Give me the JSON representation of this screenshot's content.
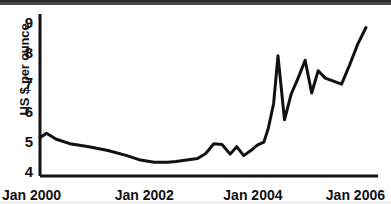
{
  "chart_data": {
    "type": "line",
    "title": "",
    "subtitle": "",
    "xlabel": "",
    "ylabel": "US $ per ounce",
    "ylim": [
      4,
      9
    ],
    "yticks": [
      4,
      5,
      6,
      7,
      8,
      9
    ],
    "ytick_labels": [
      "4",
      "5",
      "6",
      "7",
      "8",
      "9"
    ],
    "xlim": [
      "Jan 2000",
      "Jan 2006"
    ],
    "xticks": [
      "Jan 2000",
      "Jan 2002",
      "Jan 2004",
      "Jan 2006"
    ],
    "xtick_labels": [
      "Jan 2000",
      "Jan 2002",
      "Jan 2004",
      "Jan 2006"
    ],
    "grid": false,
    "legend": false,
    "legend_position": "none",
    "line_color": "#111111",
    "line_width": 3,
    "series": [
      {
        "name": "Silver price",
        "x": [
          0.0,
          0.12,
          0.3,
          0.55,
          0.9,
          1.25,
          1.6,
          1.85,
          2.1,
          2.35,
          2.5,
          2.7,
          2.9,
          3.05,
          3.2,
          3.35,
          3.5,
          3.62,
          3.75,
          3.88,
          4.0,
          4.12,
          4.2,
          4.3,
          4.38,
          4.5,
          4.62,
          4.75,
          4.88,
          5.0,
          5.12,
          5.25,
          5.4,
          5.55,
          5.7,
          5.85,
          6.0
        ],
        "values": [
          5.15,
          5.3,
          5.1,
          4.95,
          4.85,
          4.72,
          4.55,
          4.4,
          4.33,
          4.33,
          4.35,
          4.4,
          4.45,
          4.62,
          4.95,
          4.92,
          4.6,
          4.85,
          4.55,
          4.72,
          4.9,
          5.0,
          5.45,
          6.3,
          7.9,
          5.75,
          6.6,
          7.15,
          7.75,
          6.65,
          7.4,
          7.15,
          7.05,
          6.95,
          7.6,
          8.3,
          8.85
        ]
      }
    ],
    "annotations": []
  }
}
